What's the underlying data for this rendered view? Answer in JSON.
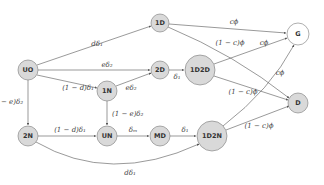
{
  "diagram": {
    "type": "state-transition-graph",
    "colors": {
      "node_fill": "#d9d9d9",
      "node_fill_terminal_g": "#ffffff",
      "node_stroke": "#777777",
      "edge": "#555555",
      "text": "#333333"
    },
    "nodes": [
      {
        "id": "UO",
        "label": "UO",
        "x": 28,
        "y": 70,
        "r": 10,
        "fill": "gray"
      },
      {
        "id": "1D",
        "label": "1D",
        "x": 160,
        "y": 23,
        "r": 9,
        "fill": "gray"
      },
      {
        "id": "2D",
        "label": "2D",
        "x": 160,
        "y": 70,
        "r": 9,
        "fill": "gray"
      },
      {
        "id": "1N",
        "label": "1N",
        "x": 107,
        "y": 91,
        "r": 10,
        "fill": "gray"
      },
      {
        "id": "1D2D",
        "label": "1D2D",
        "x": 200,
        "y": 70,
        "r": 15,
        "fill": "gray"
      },
      {
        "id": "G",
        "label": "G",
        "x": 298,
        "y": 34,
        "r": 11,
        "fill": "white"
      },
      {
        "id": "D",
        "label": "D",
        "x": 298,
        "y": 103,
        "r": 10,
        "fill": "gray"
      },
      {
        "id": "2N",
        "label": "2N",
        "x": 28,
        "y": 136,
        "r": 10,
        "fill": "gray"
      },
      {
        "id": "UN",
        "label": "UN",
        "x": 107,
        "y": 136,
        "r": 10,
        "fill": "gray"
      },
      {
        "id": "MD",
        "label": "MD",
        "x": 160,
        "y": 136,
        "r": 10,
        "fill": "gray"
      },
      {
        "id": "1D2N",
        "label": "1D2N",
        "x": 212,
        "y": 136,
        "r": 15,
        "fill": "gray"
      }
    ],
    "edges": [
      {
        "from": "UO",
        "to": "1D",
        "label": "dδ₁"
      },
      {
        "from": "UO",
        "to": "2D",
        "label": "eδ₂"
      },
      {
        "from": "UO",
        "to": "1N",
        "label": "(1 − d)δ₁"
      },
      {
        "from": "UO",
        "to": "2N",
        "label": "(1 − e)δ₂"
      },
      {
        "from": "1N",
        "to": "2D",
        "label": "eδ₂"
      },
      {
        "from": "1N",
        "to": "UN",
        "label": "(1 − e)δ₂"
      },
      {
        "from": "2D",
        "to": "1D2D",
        "label": "δ₁"
      },
      {
        "from": "1D",
        "to": "G",
        "label": "cϕ"
      },
      {
        "from": "1D",
        "to": "D",
        "label": "(1 − c)ϕ"
      },
      {
        "from": "1D2D",
        "to": "G",
        "label": "cϕ"
      },
      {
        "from": "1D2D",
        "to": "D",
        "label": "(1 − c)ϕ"
      },
      {
        "from": "2N",
        "to": "UN",
        "label": "(1 − d)δ₁"
      },
      {
        "from": "2N",
        "to": "1D2N",
        "label": "dδ₁"
      },
      {
        "from": "UN",
        "to": "MD",
        "label": "δₘ"
      },
      {
        "from": "MD",
        "to": "1D2N",
        "label": "δ₁"
      },
      {
        "from": "1D2N",
        "to": "G",
        "label": "cϕ"
      },
      {
        "from": "1D2N",
        "to": "D",
        "label": "(1 − c)ϕ"
      }
    ]
  }
}
